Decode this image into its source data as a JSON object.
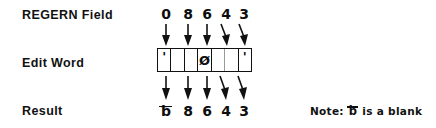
{
  "diagram": {
    "ink_color": "#111111",
    "background_color": "#ffffff"
  },
  "rows": {
    "source": {
      "label": "REGERN Field",
      "digits": [
        "0",
        "8",
        "6",
        "4",
        "3"
      ]
    },
    "editword": {
      "label": "Edit Word",
      "cells": [
        "'",
        "",
        "",
        "Ø",
        "",
        "",
        "'"
      ]
    },
    "result": {
      "label": "Result",
      "values": [
        "ƀ",
        "8",
        "6",
        "4",
        "3"
      ],
      "blank_symbol": "ƀ"
    }
  },
  "arrows": {
    "top_count": 5,
    "bottom_count": 5,
    "direction": "down"
  },
  "note": {
    "prefix": "Note:",
    "symbol": "ƀ",
    "suffix": "is a blank"
  }
}
